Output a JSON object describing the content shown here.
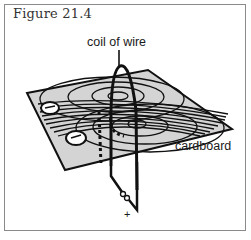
{
  "figure": {
    "title": "Figure 21.4",
    "labels": {
      "coil": "coil of wire",
      "cardboard": "cardboard",
      "terminal": "+"
    },
    "colors": {
      "board_fill": "#d4d4d4",
      "line": "#111111",
      "frame": "#8a8a8a"
    },
    "elements": [
      "cardboard sheet",
      "magnetic field lines",
      "coil of wire",
      "compass",
      "compass",
      "battery terminals"
    ]
  }
}
